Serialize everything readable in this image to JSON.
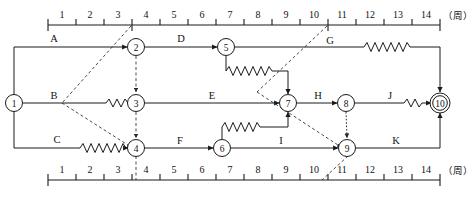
{
  "diagram": {
    "kind": "time-scaled-network-diagram",
    "axis": {
      "unit_label": "（周）",
      "tick_numbers": [
        "1",
        "2",
        "3",
        "4",
        "5",
        "6",
        "7",
        "8",
        "9",
        "10",
        "11",
        "12",
        "13",
        "14"
      ],
      "tick_start_week": 0,
      "tick_end_week": 14,
      "top_axis": true,
      "bottom_axis": true
    },
    "colors": {
      "line": "#1a1a1a",
      "dashed": "#2a2a2a",
      "text": "#111111",
      "background": "#ffffff"
    },
    "nodes": [
      {
        "id": "1",
        "label": "1",
        "x": 14,
        "y": 103,
        "double": false
      },
      {
        "id": "2",
        "label": "2",
        "x": 136,
        "y": 47,
        "double": false
      },
      {
        "id": "3",
        "label": "3",
        "x": 136,
        "y": 103,
        "double": false
      },
      {
        "id": "4",
        "label": "4",
        "x": 136,
        "y": 148,
        "double": false
      },
      {
        "id": "5",
        "label": "5",
        "x": 226,
        "y": 47,
        "double": false
      },
      {
        "id": "6",
        "label": "6",
        "x": 222,
        "y": 148,
        "double": false
      },
      {
        "id": "7",
        "label": "7",
        "x": 288,
        "y": 103,
        "double": false
      },
      {
        "id": "8",
        "label": "8",
        "x": 346,
        "y": 103,
        "double": false
      },
      {
        "id": "9",
        "label": "9",
        "x": 347,
        "y": 148,
        "double": false
      },
      {
        "id": "10",
        "label": "10",
        "x": 440,
        "y": 103,
        "double": true
      }
    ],
    "activities": [
      {
        "code": "A",
        "from": "1",
        "to": "2",
        "label_x": 54,
        "label_y": 42
      },
      {
        "code": "B",
        "from": "1",
        "to": "3",
        "label_x": 54,
        "label_y": 99
      },
      {
        "code": "C",
        "from": "1",
        "to": "4",
        "label_x": 57,
        "label_y": 142
      },
      {
        "code": "D",
        "from": "2",
        "to": "5",
        "label_x": 181,
        "label_y": 42
      },
      {
        "code": "E",
        "from": "3",
        "to": "7",
        "label_x": 212,
        "label_y": 99
      },
      {
        "code": "F",
        "from": "4",
        "to": "6",
        "label_x": 180,
        "label_y": 144
      },
      {
        "code": "G",
        "from": "5",
        "to": "10",
        "label_x": 330,
        "label_y": 44
      },
      {
        "code": "H",
        "from": "7",
        "to": "8",
        "label_x": 318,
        "label_y": 99
      },
      {
        "code": "I",
        "from": "6",
        "to": "9",
        "label_x": 281,
        "label_y": 144
      },
      {
        "code": "J",
        "from": "8",
        "to": "10",
        "label_x": 390,
        "label_y": 99
      },
      {
        "code": "K",
        "from": "9",
        "to": "10",
        "label_x": 396,
        "label_y": 144
      }
    ],
    "dummy_links": [
      {
        "from": "2",
        "to": "3",
        "style": "dashed-vertical"
      },
      {
        "from": "3",
        "to": "4",
        "style": "dashed-vertical"
      },
      {
        "from": "8",
        "to": "9",
        "style": "dotted-vertical"
      }
    ],
    "float_marks": [
      {
        "on": "C",
        "note": "wavy free-float on C before node 4"
      },
      {
        "on": "B",
        "note": "wavy free-float on B before node 3"
      },
      {
        "on": "D5",
        "note": "wavy free-float below node 5 toward node 7"
      },
      {
        "on": "I",
        "note": "wavy free-float above node 6 toward node 9"
      },
      {
        "on": "G",
        "note": "wavy free-float on G before node 10"
      },
      {
        "on": "J",
        "note": "wavy free-float on J before node 10"
      }
    ],
    "guide_lines": [
      {
        "at_week": 4,
        "note": "dashed guide from top axis week 4 down to node 4"
      },
      {
        "at_week": 10,
        "note": "dashed guide from top axis week 10 down to node 9 and to bottom axis week 10-11"
      }
    ]
  }
}
